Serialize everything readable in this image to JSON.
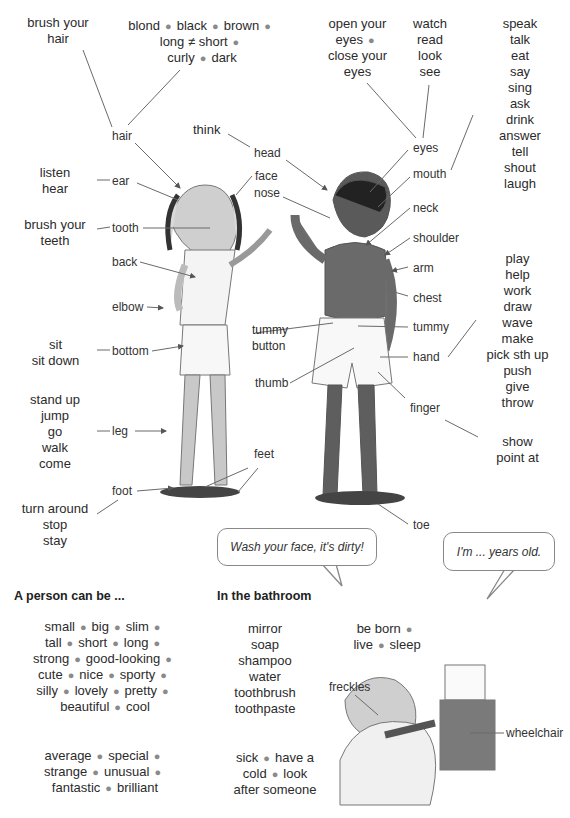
{
  "hair_verbs": {
    "lines": [
      "brush your",
      "hair"
    ]
  },
  "hair_adjectives": {
    "rows": [
      [
        "blond",
        "black",
        "brown"
      ],
      [
        "long ≠ short"
      ],
      [
        "curly",
        "dark"
      ]
    ]
  },
  "eyes_verbs_1": {
    "lines": [
      "open your",
      "eyes",
      "close your",
      "eyes"
    ]
  },
  "eyes_verbs_2": {
    "lines": [
      "watch",
      "read",
      "look",
      "see"
    ]
  },
  "mouth_verbs": {
    "lines": [
      "speak",
      "talk",
      "eat",
      "say",
      "sing",
      "ask",
      "drink",
      "answer",
      "tell",
      "shout",
      "laugh"
    ]
  },
  "ear_verbs": {
    "lines": [
      "listen",
      "hear"
    ]
  },
  "tooth_verbs": {
    "lines": [
      "brush your",
      "teeth"
    ]
  },
  "bottom_verbs": {
    "lines": [
      "sit",
      "sit down"
    ]
  },
  "leg_verbs": {
    "lines": [
      "stand up",
      "jump",
      "go",
      "walk",
      "come"
    ]
  },
  "foot_verbs": {
    "lines": [
      "turn around",
      "stop",
      "stay"
    ]
  },
  "hand_verbs": {
    "lines": [
      "play",
      "help",
      "work",
      "draw",
      "wave",
      "make",
      "pick sth up",
      "push",
      "give",
      "throw"
    ]
  },
  "finger_verbs": {
    "lines": [
      "show",
      "point at"
    ]
  },
  "head_verb": "think",
  "body_labels": {
    "hair": "hair",
    "head": "head",
    "ear": "ear",
    "face": "face",
    "nose": "nose",
    "tooth": "tooth",
    "back": "back",
    "elbow": "elbow",
    "bottom": "bottom",
    "leg": "leg",
    "foot": "foot",
    "feet": "feet",
    "eyes": "eyes",
    "mouth": "mouth",
    "neck": "neck",
    "shoulder": "shoulder",
    "arm": "arm",
    "chest": "chest",
    "tummy": "tummy",
    "tummy_button": [
      "tummy",
      "button"
    ],
    "hand": "hand",
    "thumb": "thumb",
    "finger": "finger",
    "toe": "toe"
  },
  "speech_bubbles": {
    "wash": "Wash your face, it's dirty!",
    "age": "I'm ... years old."
  },
  "person_section": {
    "heading": "A person can be ...",
    "rows1": [
      [
        "small",
        "big",
        "slim"
      ],
      [
        "tall",
        "short",
        "long"
      ],
      [
        "strong",
        "good-looking"
      ],
      [
        "cute",
        "nice",
        "sporty"
      ],
      [
        "silly",
        "lovely",
        "pretty"
      ],
      [
        "beautiful",
        "cool"
      ]
    ],
    "rows2": [
      [
        "average",
        "special"
      ],
      [
        "strange",
        "unusual"
      ],
      [
        "fantastic",
        "brilliant"
      ]
    ]
  },
  "bathroom_section": {
    "heading": "In the bathroom",
    "items": [
      "mirror",
      "soap",
      "shampoo",
      "water",
      "toothbrush",
      "toothpaste"
    ],
    "sick_rows": [
      [
        "sick",
        "have a"
      ],
      [
        "cold",
        "look"
      ],
      [
        "after someone"
      ]
    ]
  },
  "life_verbs": {
    "rows": [
      [
        "be born"
      ],
      [
        "live",
        "sleep"
      ]
    ]
  },
  "illustration_labels": {
    "freckles": "freckles",
    "wheelchair": "wheelchair"
  }
}
